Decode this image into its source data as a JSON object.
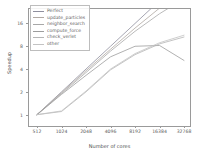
{
  "chart_data": {
    "type": "line",
    "title": "",
    "xlabel": "Number of cores",
    "ylabel": "Speedup",
    "xscale": "log2",
    "yscale": "log2",
    "xlim": [
      512,
      32768
    ],
    "ylim": [
      0.85,
      22
    ],
    "grid": false,
    "legend_position": "upper left",
    "xticks": [
      "512",
      "1024",
      "2048",
      "4096",
      "8192",
      "16384",
      "32768"
    ],
    "xtick_values": [
      512,
      1024,
      2048,
      4096,
      8192,
      16384,
      32768
    ],
    "yticks": [
      "1",
      "2",
      "4",
      "8",
      "16"
    ],
    "ytick_values": [
      1,
      2,
      4,
      8,
      16
    ],
    "x": [
      512,
      1024,
      2048,
      4096,
      8192,
      16384,
      32768
    ],
    "series": [
      {
        "name": "Perfect",
        "color": "#8f8f9e",
        "values": [
          1,
          2,
          4,
          8,
          16,
          32,
          64
        ]
      },
      {
        "name": "update_particles",
        "color": "#b0a8a2",
        "values": [
          1,
          1.95,
          3.8,
          7.3,
          13.9,
          25.5,
          44.0
        ]
      },
      {
        "name": "neighbor_search",
        "color": "#a8a8a8",
        "values": [
          1,
          1.9,
          3.6,
          6.9,
          12.6,
          21.5,
          34.0
        ]
      },
      {
        "name": "compute_force",
        "color": "#9d9d9d",
        "values": [
          1,
          1.85,
          3.3,
          5.8,
          8.0,
          8.2,
          5.2
        ]
      },
      {
        "name": "check_verlet",
        "color": "#b5b5b5",
        "values": [
          1,
          1.1,
          2.0,
          3.9,
          6.2,
          8.6,
          10.6
        ]
      },
      {
        "name": "other",
        "color": "#c3c3c3",
        "values": [
          1,
          1.12,
          2.05,
          4.0,
          6.4,
          8.9,
          11.2
        ]
      }
    ]
  }
}
